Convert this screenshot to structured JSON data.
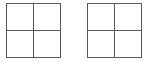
{
  "diagram": {
    "line_color": "#5a5a5a",
    "background": "#ffffff",
    "grids": [
      {
        "rows": 2,
        "cols": 2,
        "cells": [
          "",
          "",
          "",
          ""
        ]
      },
      {
        "rows": 2,
        "cols": 2,
        "cells": [
          "",
          "",
          "",
          ""
        ]
      }
    ]
  }
}
